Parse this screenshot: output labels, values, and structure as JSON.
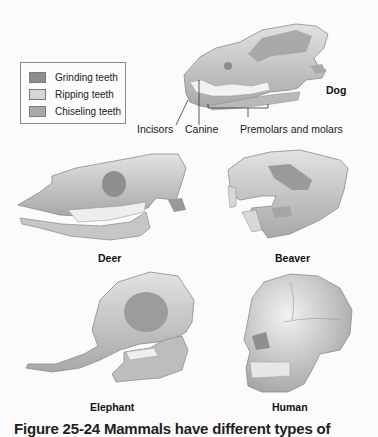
{
  "legend": {
    "items": [
      {
        "label": "Grinding teeth",
        "color": "#8d8d8d"
      },
      {
        "label": "Ripping teeth",
        "color": "#d6d6d6"
      },
      {
        "label": "Chiseling teeth",
        "color": "#a9a9a9"
      }
    ]
  },
  "dog": {
    "name": "Dog",
    "labels": {
      "incisors": "Incisors",
      "canine": "Canine",
      "premolars_molars": "Premolars and molars"
    }
  },
  "animals": {
    "deer": "Deer",
    "beaver": "Beaver",
    "elephant": "Elephant",
    "human": "Human"
  },
  "caption": "Figure 25-24 Mammals have different types of",
  "colors": {
    "bone": "#cfcfcf",
    "bone_shadow": "#9a9a9a",
    "teeth": "#efefef",
    "background": "#fbfbfb"
  }
}
